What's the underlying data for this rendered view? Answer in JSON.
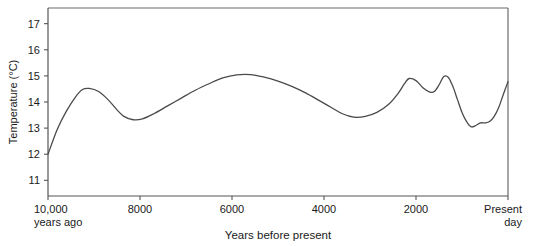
{
  "chart_data": {
    "type": "line",
    "title": "",
    "xlabel": "Years before present",
    "ylabel": "Temperature (°C)",
    "xlim": [
      10000,
      0
    ],
    "ylim": [
      10.4,
      17.6
    ],
    "grid": false,
    "legend": "none",
    "x_tick_labels": [
      "10,000",
      "8000",
      "6000",
      "4000",
      "2000",
      "Present"
    ],
    "x_tick_values": [
      10000,
      8000,
      6000,
      4000,
      2000,
      0
    ],
    "x_tick_sublabels": [
      "years ago",
      "",
      "",
      "",
      "",
      "day"
    ],
    "y_tick_labels": [
      "17",
      "16",
      "15",
      "14",
      "13",
      "12",
      "11"
    ],
    "y_tick_values": [
      17,
      16,
      15,
      14,
      13,
      12,
      11
    ],
    "series": [
      {
        "name": "Global mean temperature",
        "x": [
          10000,
          9800,
          9600,
          9400,
          9250,
          9100,
          8900,
          8700,
          8500,
          8350,
          8150,
          7950,
          7700,
          7400,
          7100,
          6800,
          6500,
          6200,
          5900,
          5600,
          5300,
          5000,
          4700,
          4400,
          4100,
          3850,
          3600,
          3350,
          3100,
          2850,
          2600,
          2400,
          2250,
          2150,
          2000,
          1850,
          1700,
          1600,
          1500,
          1400,
          1300,
          1200,
          1100,
          1000,
          900,
          800,
          700,
          600,
          500,
          400,
          300,
          200,
          100,
          0
        ],
        "y": [
          12.0,
          12.95,
          13.65,
          14.2,
          14.48,
          14.52,
          14.4,
          14.1,
          13.7,
          13.45,
          13.32,
          13.35,
          13.55,
          13.85,
          14.15,
          14.45,
          14.7,
          14.92,
          15.04,
          15.05,
          14.95,
          14.8,
          14.6,
          14.35,
          14.05,
          13.8,
          13.55,
          13.42,
          13.45,
          13.6,
          13.9,
          14.3,
          14.7,
          14.9,
          14.82,
          14.55,
          14.38,
          14.4,
          14.65,
          14.97,
          14.95,
          14.6,
          14.1,
          13.6,
          13.25,
          13.05,
          13.1,
          13.2,
          13.2,
          13.25,
          13.45,
          13.8,
          14.3,
          14.78
        ]
      }
    ]
  },
  "axes": {
    "y_axis_title": "Temperature (°C)",
    "x_axis_title": "Years before present",
    "x_left_label_line1": "10,000",
    "x_left_label_line2": "years ago",
    "x_right_label_line1": "Present",
    "x_right_label_line2": "day"
  },
  "colors": {
    "curve": "#4a4a4a",
    "axis": "#555555",
    "frame": "#6b6b6b",
    "text": "#1a1a1a",
    "background": "#ffffff"
  }
}
